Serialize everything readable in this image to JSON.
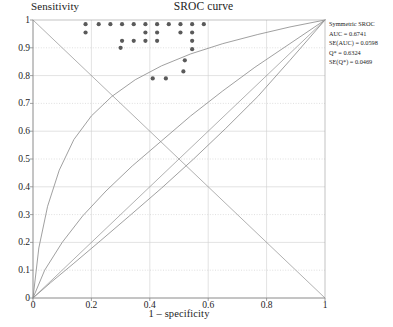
{
  "chart_data": {
    "type": "scatter",
    "title": "SROC curve",
    "xlabel": "1 – specificity",
    "ylabel": "Sensitivity",
    "xlim": [
      0,
      1
    ],
    "ylim": [
      0,
      1
    ],
    "grid": true,
    "xticks": [
      "0",
      "0.2",
      "0.4",
      "0.6",
      "0.8",
      "1"
    ],
    "xtick_values": [
      0,
      0.2,
      0.4,
      0.6,
      0.8,
      1
    ],
    "yticks": [
      "0",
      "0.1",
      "0.2",
      "0.3",
      "0.4",
      "0.5",
      "0.6",
      "0.7",
      "0.8",
      "0.9",
      "1"
    ],
    "ytick_values": [
      0,
      0.1,
      0.2,
      0.3,
      0.4,
      0.5,
      0.6,
      0.7,
      0.8,
      0.9,
      1
    ],
    "points": [
      {
        "x": 0.18,
        "y": 0.985
      },
      {
        "x": 0.18,
        "y": 0.955
      },
      {
        "x": 0.225,
        "y": 0.985
      },
      {
        "x": 0.265,
        "y": 0.985
      },
      {
        "x": 0.305,
        "y": 0.985
      },
      {
        "x": 0.305,
        "y": 0.925
      },
      {
        "x": 0.345,
        "y": 0.985
      },
      {
        "x": 0.345,
        "y": 0.925
      },
      {
        "x": 0.385,
        "y": 0.985
      },
      {
        "x": 0.385,
        "y": 0.955
      },
      {
        "x": 0.385,
        "y": 0.925
      },
      {
        "x": 0.425,
        "y": 0.985
      },
      {
        "x": 0.425,
        "y": 0.955
      },
      {
        "x": 0.425,
        "y": 0.925
      },
      {
        "x": 0.465,
        "y": 0.985
      },
      {
        "x": 0.505,
        "y": 0.985
      },
      {
        "x": 0.505,
        "y": 0.955
      },
      {
        "x": 0.545,
        "y": 0.985
      },
      {
        "x": 0.545,
        "y": 0.955
      },
      {
        "x": 0.545,
        "y": 0.925
      },
      {
        "x": 0.545,
        "y": 0.895
      },
      {
        "x": 0.585,
        "y": 0.985
      },
      {
        "x": 0.52,
        "y": 0.855
      },
      {
        "x": 0.515,
        "y": 0.815
      },
      {
        "x": 0.3,
        "y": 0.9
      },
      {
        "x": 0.41,
        "y": 0.79
      },
      {
        "x": 0.455,
        "y": 0.79
      }
    ],
    "curves": [
      {
        "name": "sroc-upper",
        "kind": "sroc",
        "points": [
          [
            0,
            0
          ],
          [
            0.02,
            0.18
          ],
          [
            0.05,
            0.33
          ],
          [
            0.09,
            0.46
          ],
          [
            0.14,
            0.57
          ],
          [
            0.2,
            0.655
          ],
          [
            0.27,
            0.725
          ],
          [
            0.35,
            0.785
          ],
          [
            0.44,
            0.835
          ],
          [
            0.54,
            0.878
          ],
          [
            0.65,
            0.915
          ],
          [
            0.77,
            0.948
          ],
          [
            0.88,
            0.975
          ],
          [
            1,
            1
          ]
        ]
      },
      {
        "name": "sroc-middle",
        "kind": "sroc",
        "points": [
          [
            0,
            0
          ],
          [
            0.04,
            0.1
          ],
          [
            0.1,
            0.2
          ],
          [
            0.17,
            0.295
          ],
          [
            0.25,
            0.385
          ],
          [
            0.34,
            0.475
          ],
          [
            0.44,
            0.565
          ],
          [
            0.54,
            0.655
          ],
          [
            0.65,
            0.745
          ],
          [
            0.76,
            0.83
          ],
          [
            0.88,
            0.915
          ],
          [
            1,
            1
          ]
        ]
      },
      {
        "name": "sroc-lower",
        "kind": "sroc",
        "points": [
          [
            0,
            0
          ],
          [
            0.06,
            0.055
          ],
          [
            0.14,
            0.125
          ],
          [
            0.23,
            0.205
          ],
          [
            0.33,
            0.295
          ],
          [
            0.44,
            0.395
          ],
          [
            0.55,
            0.5
          ],
          [
            0.66,
            0.61
          ],
          [
            0.77,
            0.725
          ],
          [
            0.88,
            0.855
          ],
          [
            1,
            1
          ]
        ]
      },
      {
        "name": "anti-diagonal",
        "kind": "line",
        "points": [
          [
            0,
            1
          ],
          [
            1,
            0
          ]
        ]
      },
      {
        "name": "identity-diagonal",
        "kind": "line",
        "points": [
          [
            0,
            0
          ],
          [
            1,
            1
          ]
        ]
      }
    ]
  },
  "legend": {
    "title": "Symmetric SROC",
    "lines": [
      "AUC = 0.6741",
      "SE(AUC) = 0.0598",
      "Q* = 0.6324",
      "SE(Q*) = 0.0469"
    ]
  },
  "colors": {
    "point": "#5a5a5a",
    "curve": "#8f8f8f",
    "axis": "#9a9a9a",
    "grid": "#cfcfcf",
    "grid_dotted": "#c9c9c9",
    "text": "#1d1d1d",
    "background": "#ffffff"
  }
}
